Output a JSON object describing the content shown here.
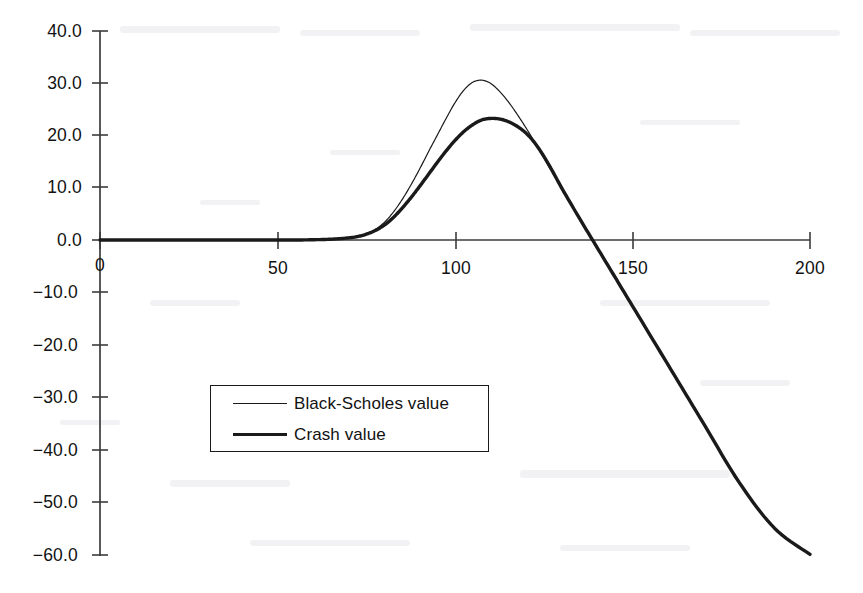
{
  "chart_data": {
    "type": "line",
    "title": "",
    "subtitle": "",
    "xlabel": "",
    "ylabel": "",
    "xlim": [
      0,
      200
    ],
    "ylim": [
      -60,
      40
    ],
    "grid": false,
    "legend_position": "center-left",
    "x_ticks": [
      "0",
      "50",
      "100",
      "150",
      "200"
    ],
    "x_tick_values": [
      0,
      50,
      100,
      150,
      200
    ],
    "y_ticks": [
      "40.0",
      "30.0",
      "20.0",
      "10.0",
      "0.0",
      "−10.0",
      "−20.0",
      "−30.0",
      "−40.0",
      "−50.0",
      "−60.0"
    ],
    "y_tick_values": [
      40,
      30,
      20,
      10,
      0,
      -10,
      -20,
      -30,
      -40,
      -50,
      -60
    ],
    "x": [
      0,
      10,
      20,
      30,
      40,
      50,
      55,
      60,
      65,
      70,
      72.5,
      75,
      77.5,
      80,
      82.5,
      85,
      87.5,
      90,
      92.5,
      95,
      97.5,
      100,
      102.5,
      105,
      107.5,
      110,
      112.5,
      115,
      117.5,
      120,
      122.5,
      125,
      127.5,
      130,
      135,
      140,
      145,
      150,
      160,
      170,
      180,
      190,
      200
    ],
    "series": [
      {
        "name": "Black-Scholes value",
        "line_style": "thin",
        "line_width_px": 1.2,
        "color": "#1a1a1a",
        "values": [
          0,
          0,
          0,
          0,
          0,
          0,
          0,
          0.05,
          0.15,
          0.4,
          0.7,
          1.2,
          2.0,
          3.3,
          5.2,
          7.6,
          10.4,
          13.5,
          16.8,
          20.0,
          23.2,
          26.2,
          28.6,
          30.1,
          30.5,
          29.9,
          28.4,
          26.4,
          24.0,
          21.4,
          18.6,
          15.7,
          12.8,
          9.9,
          4.2,
          -1.4,
          -7.0,
          -12.6,
          -23.8,
          -35.0,
          -46.2,
          -55.0,
          -60.0
        ]
      },
      {
        "name": "Crash value",
        "line_style": "thick",
        "line_width_px": 3.4,
        "color": "#1a1a1a",
        "values": [
          0,
          0,
          0,
          0,
          0,
          0,
          0,
          0.05,
          0.15,
          0.4,
          0.65,
          1.1,
          1.8,
          2.8,
          4.2,
          6.0,
          8.0,
          10.2,
          12.5,
          14.8,
          17.0,
          19.0,
          20.7,
          22.0,
          22.9,
          23.2,
          23.1,
          22.6,
          21.7,
          20.4,
          18.5,
          16.0,
          13.1,
          10.0,
          4.2,
          -1.4,
          -7.0,
          -12.6,
          -23.8,
          -35.0,
          -46.2,
          -55.0,
          -60.0
        ]
      }
    ],
    "annotations": {
      "bs_peak": {
        "x": 107.5,
        "y": 30.5
      },
      "crash_peak": {
        "x": 110,
        "y": 23.2
      },
      "zero_crossing": {
        "x": 140,
        "y": 0
      }
    }
  },
  "legend": {
    "entries": [
      {
        "label": "Black-Scholes value",
        "swatch": "thin-line"
      },
      {
        "label": "Crash value",
        "swatch": "thick-line"
      }
    ]
  },
  "axes": {
    "origin_label": "0"
  },
  "colors": {
    "ink": "#1a1a1a",
    "axis": "#3c3c3c",
    "paper": "#ffffff"
  }
}
